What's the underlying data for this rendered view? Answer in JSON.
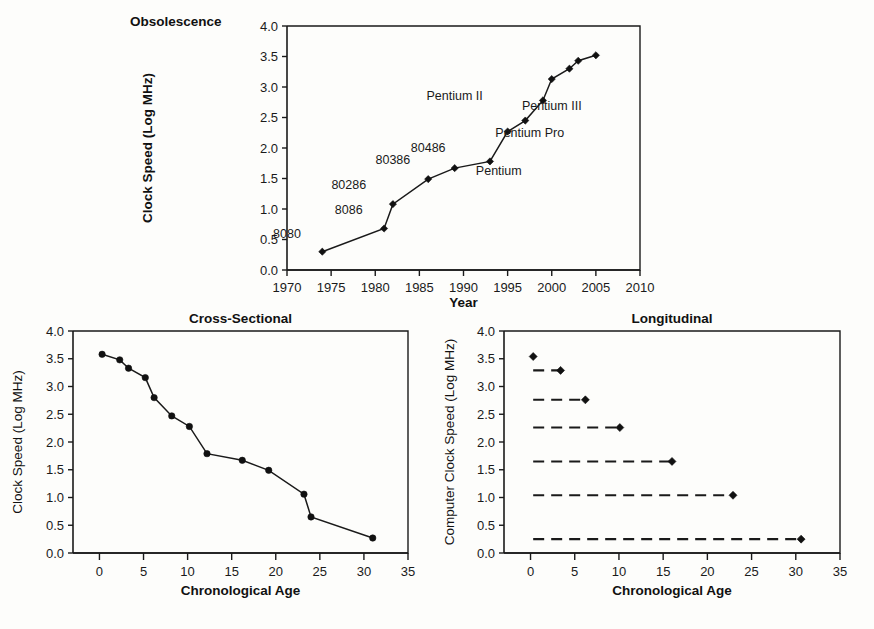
{
  "page": {
    "background": "#fdfdfb",
    "ink": "#1a1a1a"
  },
  "panels": {
    "top_label": "Obsolescence",
    "bottom_left_title": "Cross-Sectional",
    "bottom_right_title": "Longitudinal"
  },
  "chart_data": [
    {
      "id": "obsolescence",
      "type": "line",
      "title": "Obsolescence",
      "xlabel": "Year",
      "ylabel": "Clock Speed (Log MHz)",
      "xlim": [
        1970,
        2010
      ],
      "ylim": [
        0.0,
        4.0
      ],
      "xticks": [
        1970,
        1975,
        1980,
        1985,
        1990,
        1995,
        2000,
        2005,
        2010
      ],
      "xticklabels": [
        "1970",
        "1975",
        "1980",
        "1985",
        "1990",
        "1995",
        "2000",
        "2005",
        "2010"
      ],
      "yticks": [
        0.0,
        0.5,
        1.0,
        1.5,
        2.0,
        2.5,
        3.0,
        3.5,
        4.0
      ],
      "yticklabels": [
        "0.0",
        "0.5",
        "1.0",
        "1.5",
        "2.0",
        "2.5",
        "3.0",
        "3.5",
        "4.0"
      ],
      "grid": false,
      "legend": "none",
      "marker": "diamond",
      "x": [
        1974,
        1981,
        1982,
        1986,
        1989,
        1993,
        1995,
        1997,
        1999,
        2000,
        2002,
        2003,
        2005
      ],
      "y": [
        0.3,
        0.68,
        1.08,
        1.49,
        1.67,
        1.78,
        2.27,
        2.45,
        2.78,
        3.13,
        3.3,
        3.43,
        3.52
      ],
      "annotations": [
        {
          "text": "8080",
          "x": 1974,
          "y": 0.3,
          "dx": -4,
          "dy": 0.22
        },
        {
          "text": "8086",
          "x": 1981,
          "y": 0.68,
          "dx": -4,
          "dy": 0.24
        },
        {
          "text": "80286",
          "x": 1982,
          "y": 1.08,
          "dx": -5,
          "dy": 0.24
        },
        {
          "text": "80386",
          "x": 1986,
          "y": 1.49,
          "dx": -4,
          "dy": 0.24
        },
        {
          "text": "80486",
          "x": 1989,
          "y": 1.67,
          "dx": -3,
          "dy": 0.27
        },
        {
          "text": "Pentium",
          "x": 1993,
          "y": 1.78,
          "dx": 1,
          "dy": -0.22
        },
        {
          "text": "Pentium Pro",
          "x": 1997,
          "y": 2.45,
          "dx": 0.5,
          "dy": -0.27
        },
        {
          "text": "Pentium II",
          "x": 1995,
          "y": 2.27,
          "dx": -6,
          "dy": 0.52
        },
        {
          "text": "Pentium III",
          "x": 2000,
          "y": 3.13,
          "dx": 0,
          "dy": -0.5
        }
      ]
    },
    {
      "id": "cross-sectional",
      "type": "line",
      "title": "Cross-Sectional",
      "xlabel": "Chronological Age",
      "ylabel": "Clock Speed (Log MHz)",
      "xlim": [
        -3,
        35
      ],
      "ylim": [
        0.0,
        4.0
      ],
      "xticks": [
        0,
        5,
        10,
        15,
        20,
        25,
        30,
        35
      ],
      "xticklabels": [
        "0",
        "5",
        "10",
        "15",
        "20",
        "25",
        "30",
        "35"
      ],
      "yticks": [
        0.0,
        0.5,
        1.0,
        1.5,
        2.0,
        2.5,
        3.0,
        3.5,
        4.0
      ],
      "yticklabels": [
        "0.0",
        "0.5",
        "1.0",
        "1.5",
        "2.0",
        "2.5",
        "3.0",
        "3.5",
        "4.0"
      ],
      "grid": false,
      "legend": "none",
      "marker": "circle",
      "x": [
        0.3,
        2.3,
        3.3,
        5.2,
        6.2,
        8.2,
        10.2,
        12.2,
        16.2,
        19.2,
        23.2,
        24.0,
        31.0
      ],
      "y": [
        3.58,
        3.48,
        3.33,
        3.16,
        2.8,
        2.47,
        2.28,
        1.79,
        1.67,
        1.49,
        1.06,
        0.65,
        0.27
      ]
    },
    {
      "id": "longitudinal",
      "type": "line",
      "title": "Longitudinal",
      "xlabel": "Chronological Age",
      "ylabel": "Computer Clock Speed (Log MHz)",
      "xlim": [
        -3,
        35
      ],
      "ylim": [
        0.0,
        4.0
      ],
      "xticks": [
        0,
        5,
        10,
        15,
        20,
        25,
        30,
        35
      ],
      "xticklabels": [
        "0",
        "5",
        "10",
        "15",
        "20",
        "25",
        "30",
        "35"
      ],
      "yticks": [
        0.0,
        0.5,
        1.0,
        1.5,
        2.0,
        2.5,
        3.0,
        3.5,
        4.0
      ],
      "yticklabels": [
        "0.0",
        "0.5",
        "1.0",
        "1.5",
        "2.0",
        "2.5",
        "3.0",
        "3.5",
        "4.0"
      ],
      "grid": false,
      "legend": "none",
      "marker": "diamond",
      "linestyle": "dashed",
      "series": [
        {
          "name": "seg1",
          "x": [
            0.3,
            0.3
          ],
          "y": [
            3.54,
            3.54
          ]
        },
        {
          "name": "seg2",
          "x": [
            0.3,
            3.4
          ],
          "y": [
            3.29,
            3.29
          ]
        },
        {
          "name": "seg3",
          "x": [
            0.3,
            6.2
          ],
          "y": [
            2.76,
            2.76
          ]
        },
        {
          "name": "seg4",
          "x": [
            0.3,
            10.1
          ],
          "y": [
            2.26,
            2.26
          ]
        },
        {
          "name": "seg5",
          "x": [
            0.3,
            16.0
          ],
          "y": [
            1.65,
            1.65
          ]
        },
        {
          "name": "seg6",
          "x": [
            0.3,
            22.9
          ],
          "y": [
            1.04,
            1.04
          ]
        },
        {
          "name": "seg7",
          "x": [
            0.3,
            30.6
          ],
          "y": [
            0.25,
            0.25
          ]
        }
      ]
    }
  ]
}
